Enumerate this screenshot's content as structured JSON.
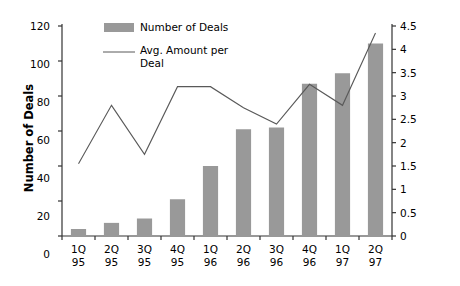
{
  "chart_data": {
    "type": "bar",
    "title": "",
    "subtitle": "",
    "categories": [
      "1Q\n95",
      "2Q\n95",
      "3Q\n95",
      "4Q\n95",
      "1Q\n96",
      "2Q\n96",
      "3Q\n96",
      "4Q\n96",
      "1Q\n97",
      "2Q\n97"
    ],
    "category_lines": [
      {
        "top": "1Q",
        "bottom": "95"
      },
      {
        "top": "2Q",
        "bottom": "95"
      },
      {
        "top": "3Q",
        "bottom": "95"
      },
      {
        "top": "4Q",
        "bottom": "95"
      },
      {
        "top": "1Q",
        "bottom": "96"
      },
      {
        "top": "2Q",
        "bottom": "96"
      },
      {
        "top": "3Q",
        "bottom": "96"
      },
      {
        "top": "4Q",
        "bottom": "96"
      },
      {
        "top": "1Q",
        "bottom": "97"
      },
      {
        "top": "2Q",
        "bottom": "97"
      }
    ],
    "series": [
      {
        "name": "Number of Deals",
        "type": "bar",
        "axis": "left",
        "color": "#999999",
        "values": [
          4,
          7.5,
          10,
          21,
          40,
          61,
          62,
          87,
          93,
          110
        ]
      },
      {
        "name": "Avg. Amount per Deal",
        "type": "line",
        "axis": "right",
        "color": "#595959",
        "values": [
          1.55,
          2.8,
          1.75,
          3.2,
          3.2,
          2.75,
          2.4,
          3.25,
          2.8,
          4.35
        ]
      }
    ],
    "xlabel": "",
    "ylabel": "Number of Deals",
    "y2label": "ECU in Millions",
    "ylim": [
      0,
      120
    ],
    "y2lim": [
      0,
      4.5
    ],
    "yticks": [
      "0",
      "20",
      "40",
      "60",
      "80",
      "100",
      "120"
    ],
    "ytick_values": [
      0,
      20,
      40,
      60,
      80,
      100,
      120
    ],
    "y2ticks": [
      "0",
      "0.5",
      "1",
      "1.5",
      "2",
      "2.5",
      "3",
      "3.5",
      "4",
      "4.5"
    ],
    "y2tick_values": [
      0,
      0.5,
      1,
      1.5,
      2,
      2.5,
      3,
      3.5,
      4,
      4.5
    ],
    "grid": false,
    "legend_position": "top-center",
    "legend": [
      {
        "label": "Number of Deals",
        "marker": "bar-swatch"
      },
      {
        "label": "Avg. Amount per Deal",
        "marker": "line-swatch"
      }
    ]
  },
  "legend": {
    "entry_1": "Number of Deals",
    "entry_2_line_1": "Avg. Amount per",
    "entry_2_line_2": "Deal"
  },
  "axes": {
    "left_title": "Number of Deals",
    "right_title": "ECU in Millions"
  },
  "colors": {
    "bar": "#999999",
    "line": "#595959",
    "axis": "#333333",
    "text": "#000000",
    "background": "#ffffff"
  }
}
